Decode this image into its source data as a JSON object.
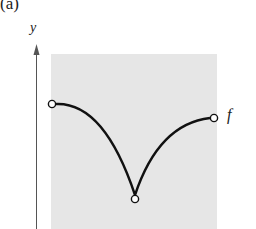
{
  "figure": {
    "panel_label": "(a)",
    "y_axis_label": "y",
    "function_label": "f",
    "colors": {
      "background": "#ffffff",
      "shaded_region": "#e6e6e6",
      "curve": "#111111",
      "axis": "#555555"
    },
    "points": [
      {
        "name": "left-endpoint",
        "open": true
      },
      {
        "name": "cusp-minimum",
        "open": true
      },
      {
        "name": "right-endpoint",
        "open": true
      }
    ]
  }
}
